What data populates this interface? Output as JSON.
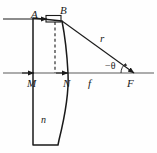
{
  "figure": {
    "kind": "optics-ray-diagram",
    "width": 157,
    "height": 153,
    "background_color": "#fefefe",
    "stroke_color": "#1a1a1a",
    "axis_color": "#555555",
    "labels": {
      "incoming_ray": "A",
      "ray_entry_point": "B",
      "radius_ray": "r",
      "angle": "−θ",
      "lens_front_vertex": "M",
      "lens_back_vertex": "N",
      "focal_length": "f",
      "focal_point": "F",
      "refractive_index": "n"
    }
  },
  "geometry": {
    "optical_axis_y": 73,
    "lens_flat_x": 33,
    "lens_vertex_x": 67,
    "lens_top_y": 18,
    "lens_bottom_y": 145,
    "point_B": [
      62,
      21
    ],
    "point_F": [
      133,
      73
    ],
    "angle_value_deg": -36
  }
}
